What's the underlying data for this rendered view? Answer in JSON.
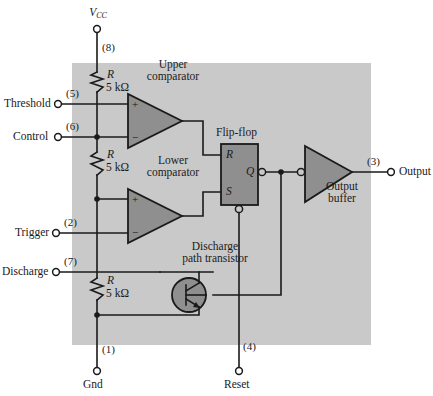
{
  "diagram": {
    "chip_fill": "#c9c9c9",
    "block_fill": "#8f8f8f",
    "line_color": "#1a1a1a",
    "supply": {
      "label": "V",
      "label_sub": "CC",
      "pin": "(8)"
    },
    "ground": {
      "label": "Gnd",
      "pin": "(1)"
    },
    "reset": {
      "label": "Reset",
      "pin": "(4)"
    },
    "output": {
      "label": "Output",
      "pin": "(3)"
    },
    "terminals": [
      {
        "name": "Threshold",
        "pin": "(5)"
      },
      {
        "name": "Control",
        "pin": "(6)"
      },
      {
        "name": "Trigger",
        "pin": "(2)"
      },
      {
        "name": "Discharge",
        "pin": "(7)"
      }
    ],
    "resistors": [
      {
        "symbol": "R",
        "value": "5 kΩ"
      },
      {
        "symbol": "R",
        "value": "5 kΩ"
      },
      {
        "symbol": "R",
        "value": "5 kΩ"
      }
    ],
    "blocks": {
      "upper_comparator": {
        "line1": "Upper",
        "line2": "comparator",
        "plus": "+",
        "minus": "−"
      },
      "lower_comparator": {
        "line1": "Lower",
        "line2": "comparator",
        "plus": "+",
        "minus": "−"
      },
      "flipflop": {
        "title": "Flip-flop",
        "r_label": "R",
        "s_label": "S",
        "q_label": "Q"
      },
      "output_buffer": {
        "line1": "Output",
        "line2": "buffer"
      },
      "transistor": {
        "line1": "Discharge",
        "line2": "path transistor"
      }
    }
  }
}
